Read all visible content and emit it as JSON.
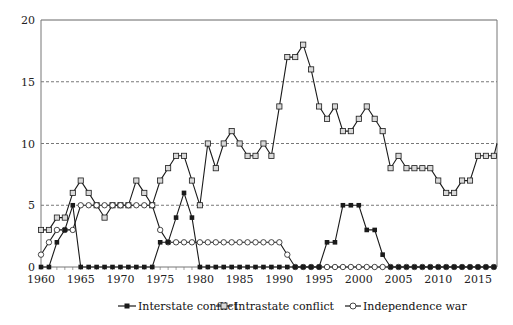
{
  "chart_data": {
    "type": "line",
    "title": "",
    "xlabel": "",
    "ylabel": "",
    "ylim": [
      0,
      20
    ],
    "xlim": [
      1960,
      2017
    ],
    "yticks": [
      0,
      5,
      10,
      15,
      20
    ],
    "xticks": [
      1960,
      1965,
      1970,
      1975,
      1980,
      1985,
      1990,
      1995,
      2000,
      2005,
      2010,
      2015
    ],
    "grid": "horizontal dashed at 5, 10, 15",
    "legend_position": "bottom",
    "x": [
      1960,
      1961,
      1962,
      1963,
      1964,
      1965,
      1966,
      1967,
      1968,
      1969,
      1970,
      1971,
      1972,
      1973,
      1974,
      1975,
      1976,
      1977,
      1978,
      1979,
      1980,
      1981,
      1982,
      1983,
      1984,
      1985,
      1986,
      1987,
      1988,
      1989,
      1990,
      1991,
      1992,
      1993,
      1994,
      1995,
      1996,
      1997,
      1998,
      1999,
      2000,
      2001,
      2002,
      2003,
      2004,
      2005,
      2006,
      2007,
      2008,
      2009,
      2010,
      2011,
      2012,
      2013,
      2014,
      2015,
      2016,
      2017
    ],
    "series": [
      {
        "name": "Interstate conflict",
        "marker": "filled-square",
        "values": [
          0,
          0,
          2,
          3,
          5,
          0,
          0,
          0,
          0,
          0,
          0,
          0,
          0,
          0,
          0,
          2,
          2,
          4,
          6,
          4,
          0,
          0,
          0,
          0,
          0,
          0,
          0,
          0,
          0,
          0,
          0,
          0,
          0,
          0,
          0,
          0,
          2,
          2,
          5,
          5,
          5,
          3,
          3,
          1,
          0,
          0,
          0,
          0,
          0,
          0,
          0,
          0,
          0,
          0,
          0,
          0,
          0,
          0
        ]
      },
      {
        "name": "Intrastate conflict",
        "marker": "hollow-square",
        "values": [
          3,
          3,
          4,
          4,
          6,
          7,
          6,
          5,
          4,
          5,
          5,
          5,
          7,
          6,
          5,
          7,
          8,
          9,
          9,
          7,
          5,
          10,
          8,
          10,
          11,
          10,
          9,
          9,
          10,
          9,
          13,
          17,
          17,
          18,
          16,
          13,
          12,
          13,
          11,
          11,
          12,
          13,
          12,
          11,
          8,
          9,
          8,
          8,
          8,
          8,
          7,
          6,
          6,
          7,
          7,
          9,
          9,
          9
        ],
        "trailing_value_at_edge": 10
      },
      {
        "name": "Independence war",
        "marker": "hollow-circle",
        "values": [
          1,
          2,
          3,
          3,
          3,
          5,
          5,
          5,
          5,
          5,
          5,
          5,
          5,
          5,
          5,
          3,
          2,
          2,
          2,
          2,
          2,
          2,
          2,
          2,
          2,
          2,
          2,
          2,
          2,
          2,
          2,
          1,
          0,
          0,
          0,
          0,
          0,
          0,
          0,
          0,
          0,
          0,
          0,
          0,
          0,
          0,
          0,
          0,
          0,
          0,
          0,
          0,
          0,
          0,
          0,
          0,
          0,
          0
        ]
      }
    ]
  },
  "legend": {
    "items": [
      {
        "label": "Interstate conflict"
      },
      {
        "label": "Intrastate conflict"
      },
      {
        "label": "Independence war"
      }
    ]
  },
  "colors": {
    "line": "#1a1a1a",
    "hollow_marker_fill": "#ffffff",
    "intrastate_marker_fill": "#d9d9d9",
    "grid": "#555555",
    "axis": "#777777"
  }
}
